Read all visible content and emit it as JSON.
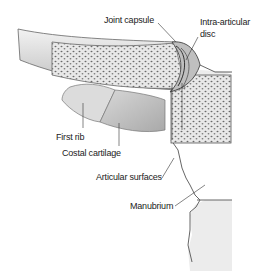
{
  "diagram": {
    "labels": {
      "joint_capsule": "Joint capsule",
      "intra_articular_disc_line1": "Intra-articular",
      "intra_articular_disc_line2": "disc",
      "first_rib": "First rib",
      "costal_cartilage": "Costal cartilage",
      "articular_surfaces": "Articular surfaces",
      "manubrium": "Manubrium"
    },
    "colors": {
      "bone_fill": "#e6e6e6",
      "cancellous_dots": "#6a6a6a",
      "cartilage": "#c8c8c8",
      "rib": "#dcdcdc",
      "outline": "#555555",
      "background": "#ffffff"
    }
  }
}
